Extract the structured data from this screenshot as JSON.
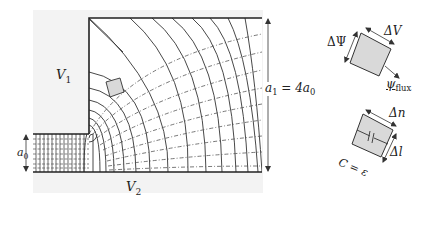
{
  "labels": {
    "v1": "V",
    "v1_sub": "1",
    "v2": "V",
    "v2_sub": "2",
    "a0": "a",
    "a0_sub": "0",
    "a1_eq_left": "a",
    "a1_sub": "1",
    "a1_eq_rest": " = 4a",
    "a1_eq_sub": "0",
    "delta_psi": "ΔΨ",
    "delta_v": "ΔV",
    "psi_flux": "ψ",
    "psi_flux_sub": "flux",
    "delta_n": "Δn",
    "delta_l": "Δl",
    "c_eq_eps": "C = ε"
  },
  "colors": {
    "background_region": "#f3f3f3",
    "line": "#333333",
    "dashed": "#555555",
    "cell_fill": "#d9d9d9"
  },
  "geometry": {
    "region": {
      "x": 33,
      "y": 10,
      "w": 230,
      "h": 183
    },
    "inner_corner": {
      "x": 89,
      "y": 134
    },
    "top_y": 18,
    "bottom_y": 172,
    "right_x": 262
  }
}
